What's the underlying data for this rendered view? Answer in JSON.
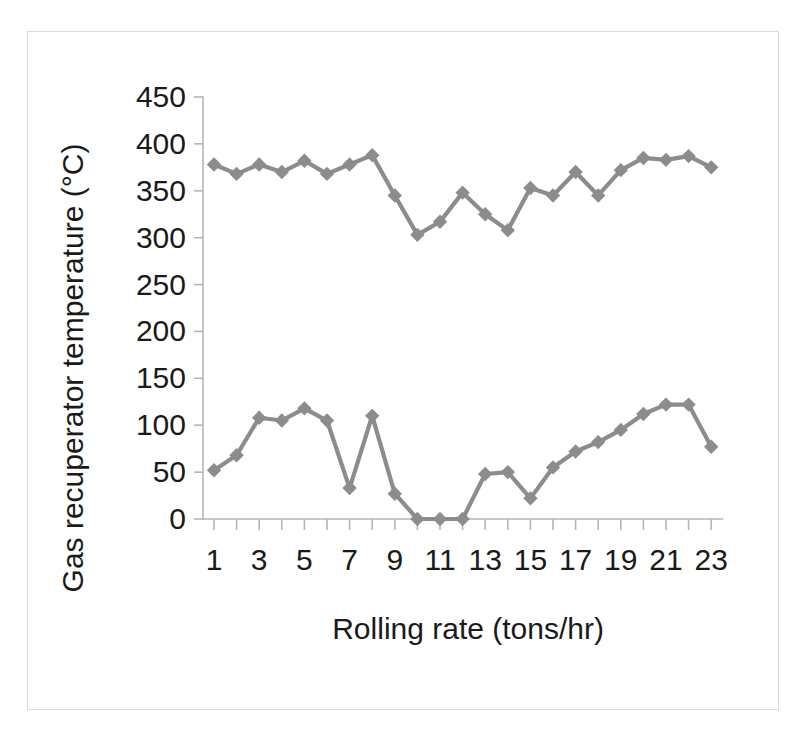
{
  "figure": {
    "border_color": "#d9d9d9",
    "background": "#ffffff"
  },
  "chart_data": {
    "type": "line",
    "title": "",
    "xlabel": "Rolling rate (tons/hr)",
    "ylabel": "Gas recuperator temperature (°C)",
    "xlim": [
      0.5,
      23.5
    ],
    "ylim": [
      0,
      450
    ],
    "grid": false,
    "legend": "none",
    "marker": "diamond",
    "series_color": "#8c8c8c",
    "x": [
      1,
      2,
      3,
      4,
      5,
      6,
      7,
      8,
      9,
      10,
      11,
      12,
      13,
      14,
      15,
      16,
      17,
      18,
      19,
      20,
      21,
      22,
      23
    ],
    "xtick_values": [
      1,
      2,
      3,
      4,
      5,
      6,
      7,
      8,
      9,
      10,
      11,
      12,
      13,
      14,
      15,
      16,
      17,
      18,
      19,
      20,
      21,
      22,
      23
    ],
    "xtick_labels": [
      "1",
      "",
      "3",
      "",
      "5",
      "",
      "7",
      "",
      "9",
      "",
      "11",
      "",
      "13",
      "",
      "15",
      "",
      "17",
      "",
      "19",
      "",
      "21",
      "",
      "23"
    ],
    "ytick_values": [
      0,
      50,
      100,
      150,
      200,
      250,
      300,
      350,
      400,
      450
    ],
    "ytick_labels": [
      "0",
      "50",
      "100",
      "150",
      "200",
      "250",
      "300",
      "350",
      "400",
      "450"
    ],
    "series": [
      {
        "name": "upper",
        "values": [
          378,
          368,
          378,
          370,
          382,
          368,
          378,
          388,
          345,
          303,
          317,
          348,
          325,
          308,
          353,
          345,
          370,
          345,
          372,
          385,
          383,
          387,
          375
        ]
      },
      {
        "name": "lower",
        "values": [
          52,
          68,
          108,
          105,
          118,
          105,
          33,
          110,
          27,
          0,
          0,
          0,
          48,
          50,
          22,
          55,
          72,
          82,
          95,
          112,
          122,
          122,
          77
        ]
      }
    ]
  }
}
